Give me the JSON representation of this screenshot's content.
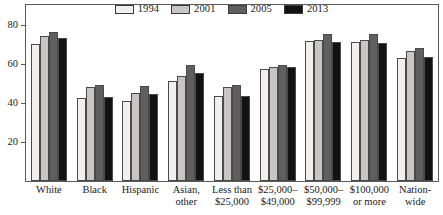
{
  "chart_data": {
    "type": "bar",
    "title": "",
    "subtitle": "",
    "xlabel": "",
    "ylabel": "",
    "ylim": [
      0,
      90
    ],
    "yticks": [
      20,
      40,
      60,
      80
    ],
    "ytick_labels": [
      "20",
      "40",
      "60",
      "80"
    ],
    "grid": false,
    "legend_position": "top-center",
    "categories": [
      "White",
      "Black",
      "Hispanic",
      "Asian, other",
      "Less than $25,000",
      "$25,000–$49,000",
      "$50,000–$99,999",
      "$100,000 or more",
      "Nation-wide"
    ],
    "category_lines": [
      [
        "White"
      ],
      [
        "Black"
      ],
      [
        "Hispanic"
      ],
      [
        "Asian,",
        "other"
      ],
      [
        "Less than",
        "$25,000"
      ],
      [
        "$25,000–",
        "$49,000"
      ],
      [
        "$50,000–",
        "$99,999"
      ],
      [
        "$100,000",
        "or more"
      ],
      [
        "Nation-",
        "wide"
      ]
    ],
    "series": [
      {
        "name": "1994",
        "color": "#f2f0ec",
        "values": [
          70,
          42.5,
          41,
          51,
          43.5,
          57.5,
          71.5,
          71,
          63
        ]
      },
      {
        "name": "2001",
        "color": "#c8c6c2",
        "values": [
          74,
          48,
          45,
          53.5,
          48,
          58.5,
          72,
          72,
          66.5
        ]
      },
      {
        "name": "2005",
        "color": "#5f5f5f",
        "values": [
          76,
          49,
          48.5,
          59.5,
          49,
          59.5,
          75,
          75,
          68
        ]
      },
      {
        "name": "2013",
        "color": "#121212",
        "values": [
          73,
          43,
          44.5,
          55,
          43.5,
          58.5,
          71,
          70.5,
          63.5
        ]
      }
    ]
  },
  "legend": {
    "items": [
      {
        "label": "1994"
      },
      {
        "label": "2001"
      },
      {
        "label": "2005"
      },
      {
        "label": "2013"
      }
    ]
  }
}
